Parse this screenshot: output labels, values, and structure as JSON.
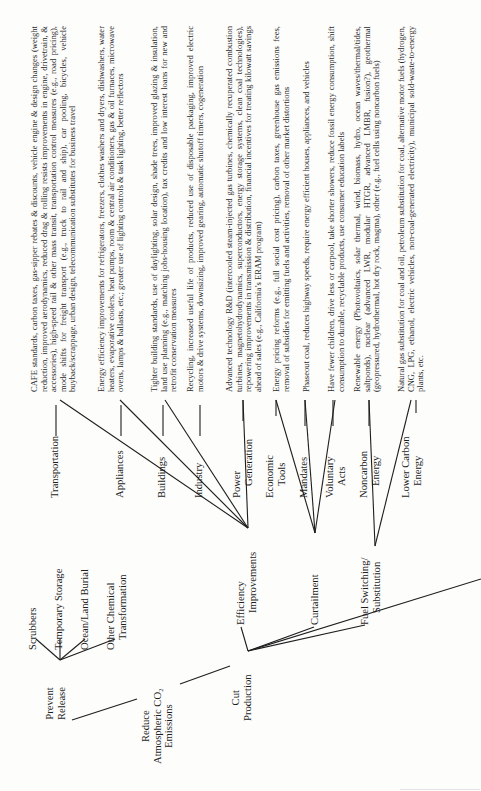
{
  "root": {
    "label_lines": [
      "Reduce",
      "Atmospheric CO₂",
      "Emissions"
    ]
  },
  "level1": [
    {
      "id": "prevent-release",
      "label_lines": [
        "Prevent",
        "Release"
      ]
    },
    {
      "id": "cut-production",
      "label_lines": [
        "Cut",
        "Production"
      ]
    }
  ],
  "prevent_release_children": [
    {
      "label_lines": [
        "Scrubbers"
      ]
    },
    {
      "label_lines": [
        "Temporary Storage"
      ]
    },
    {
      "label_lines": [
        "Ocean/Land Burial"
      ]
    },
    {
      "label_lines": [
        "Other Chemical",
        "Transformation"
      ]
    }
  ],
  "cut_production_children": [
    {
      "id": "efficiency",
      "label_lines": [
        "Efficiency",
        "Improvements"
      ]
    },
    {
      "id": "curtailment",
      "label_lines": [
        "Curtailment"
      ]
    },
    {
      "id": "fuel-switching",
      "label_lines": [
        "Fuel Switching/",
        "Substitution"
      ]
    }
  ],
  "categories": [
    {
      "label_lines": [
        "Transportation"
      ],
      "parent": "efficiency",
      "description": "CAFE standards, carbon taxes, gas-sipper rebates & discounts, vehicle engine & design changes (weight reduction, improved aerodynamics, reduced drag & rolling resists improvements in engine, drivetrain, & accessories), high-speed rail & other mass transit, transportation control measures (e.g., road pricing), mode shifts for freight transport (e.g., truck to rail and ship), car pooling, bicycles, vehicle buyback/scrappage, urban design, telecommunication substitutes for business travel"
    },
    {
      "label_lines": [
        "Appliances"
      ],
      "parent": "efficiency",
      "description": "Energy efficiency improvements for refrigerators, freezers, clothes washers and dryers, dishwashers, water heaters, evaporative coolers, heat pumps, room & central air conditioners, gas & oil furnaces, microwave ovens, lamps & ballasts, etc.; greater use of lighting controls & task lighting, better reflectors"
    },
    {
      "label_lines": [
        "Buildings"
      ],
      "parent": "efficiency",
      "description": "Tighter building standards, use of daylighting, solar design, shade trees, improved glazing & insulation, land use planning (e.g., matching jobs-housing location), tax credits and low interest loans for new and retrofit conservation measures"
    },
    {
      "label_lines": [
        "Industry"
      ],
      "parent": "efficiency",
      "description": "Recycling, increased useful life of products, reduced use of disposable packaging, improved electric motors & drive systems, downsizing, improved gearing, automatic shutoff timers, cogeneration"
    },
    {
      "label_lines": [
        "Power",
        "Generation"
      ],
      "parent": "efficiency",
      "description": "Advanced technology R&D (intercooled steam-injected gas turbines, chemically recuperated combustion turbines, magnetohydrodynamics, superconductors, energy storage systems, clean coal technologies), repowering improvements in transmission & distribution, financial incentives for treating kilowatt savings ahead of sales (e.g., California’s ERAM program)"
    },
    {
      "label_lines": [
        "Economic",
        "Tools"
      ],
      "parent": "curtailment",
      "description": "Energy pricing reforms (e.g., full social cost pricing), carbon taxes, greenhouse gas emissions fees, removal of subsidies for emitting fuels and activities, removal of other market distortions"
    },
    {
      "label_lines": [
        "Mandates"
      ],
      "parent": "curtailment",
      "description": "Phaseout coal, reduces highway speeds, require energy efficient houses, appliances, and vehicles"
    },
    {
      "label_lines": [
        "Voluntary",
        "Acts"
      ],
      "parent": "curtailment",
      "description": "Have fewer children, drive less or carpool, take shorter showers, reduce fossil energy consumption, shift consumption to durable, recyclable products, use consumer education labels"
    },
    {
      "label_lines": [
        "Noncarbon",
        "Energy"
      ],
      "parent": "fuel-switching",
      "description": "Renewable energy (Photovoltaics, solar thermal, wind, biomass, hydro, ocean waves/thermal/tides, saltponds), nuclear (advanced LWR, modular HTGR, advanced LMBR, fusion?), geothermal (geopressured, hydrothermal, hot dry rock, magma), other (e.g., fuel cells using noncarbon fuels)"
    },
    {
      "label_lines": [
        "Lower Carbon",
        "Energy"
      ],
      "parent": "fuel-switching",
      "description": "Natural gas substitution for coal and oil, petroleum substitution for coal, alternative motor fuels (hydrogen, CNG, LPG, ethanol, electric vehicles, non-coal-generated electricity), municipal sold-waste-to-energy plants, etc."
    }
  ]
}
